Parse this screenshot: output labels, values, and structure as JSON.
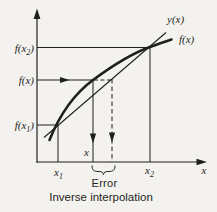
{
  "diagram": {
    "caption": "Inverse interpolation",
    "error_label": "Error",
    "colors": {
      "ink": "#1f1f1f",
      "background": "#f4f2ee"
    },
    "y_axis_labels": {
      "fx2": {
        "pre": "f(x",
        "sub": "2",
        "post": ")"
      },
      "fx": "f(x)",
      "fx1": {
        "pre": "f(x",
        "sub": "1",
        "post": ")"
      }
    },
    "curve_labels": {
      "secant_line": "y(x)",
      "function_curve": "f(x)"
    },
    "x_axis_labels": {
      "x1": {
        "pre": "x",
        "sub": "1"
      },
      "x_true": "x",
      "x2": {
        "pre": "x",
        "sub": "2"
      },
      "axis_variable": "x"
    }
  }
}
